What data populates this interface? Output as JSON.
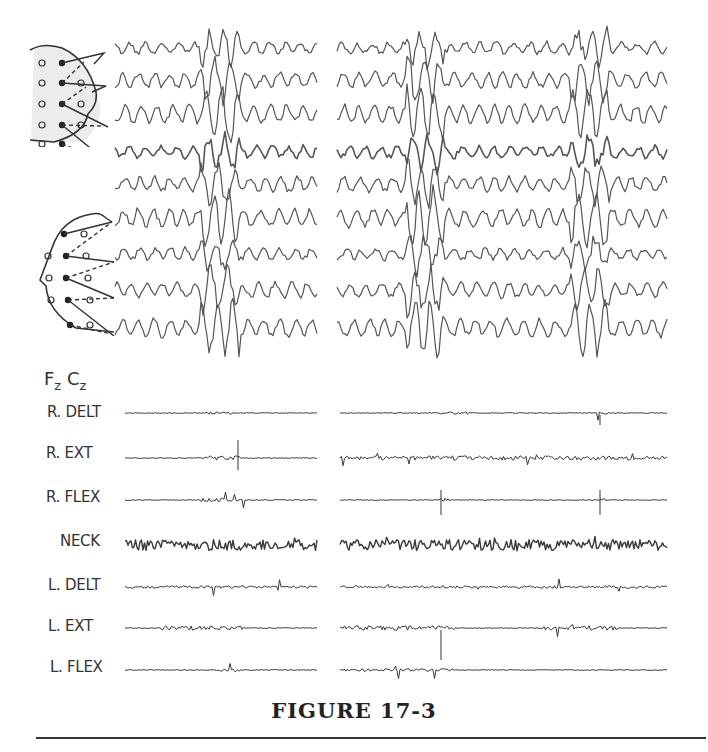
{
  "figure": {
    "caption": "FIGURE 17-3",
    "eeg": {
      "montage_top": {
        "name": "coronal-montage",
        "description": "bipolar montage diagram, frontal view of head with electrode chain"
      },
      "montage_side": {
        "name": "lateral-montage",
        "description": "bipolar montage diagram, lateral view of head facing left"
      },
      "midline_label": {
        "f": "F",
        "f_sub": "z",
        "c": "C",
        "c_sub": "z"
      },
      "channel_count": 9,
      "segments": [
        {
          "name": "left-segment",
          "x_start": 115,
          "x_end": 318
        },
        {
          "name": "right-segment",
          "x_start": 337,
          "x_end": 668
        }
      ]
    },
    "emg": {
      "channels": [
        {
          "label": "R. DELT"
        },
        {
          "label": "R. EXT"
        },
        {
          "label": "R. FLEX"
        },
        {
          "label": "NECK"
        },
        {
          "label": "L. DELT"
        },
        {
          "label": "L. EXT"
        },
        {
          "label": "L. FLEX"
        }
      ]
    },
    "colors": {
      "ink": "#3a3a3a",
      "trace": "#555555",
      "montage_shade": "#e8e8e8"
    }
  }
}
